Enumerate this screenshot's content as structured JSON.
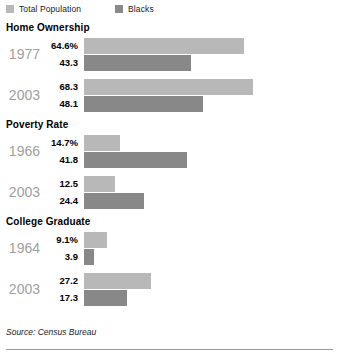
{
  "legend": {
    "items": [
      {
        "label": "Total Population",
        "color": "#b8b8b8",
        "swatch_name": "legend-swatch-total-population"
      },
      {
        "label": "Blacks",
        "color": "#888888",
        "swatch_name": "legend-swatch-blacks"
      }
    ]
  },
  "source": "Source: Census Bureau",
  "colors": {
    "total_population": "#b8b8b8",
    "blacks": "#888888",
    "year_label": "#a0a0a0",
    "rule": "#9a9a9a"
  },
  "sections": [
    {
      "title": "Home Ownership",
      "groups": [
        {
          "year": "1977",
          "bars": [
            {
              "value": "64.6%",
              "number": 64.6,
              "series": "Total Population"
            },
            {
              "value": "43.3",
              "number": 43.3,
              "series": "Blacks"
            }
          ]
        },
        {
          "year": "2003",
          "bars": [
            {
              "value": "68.3",
              "number": 68.3,
              "series": "Total Population"
            },
            {
              "value": "48.1",
              "number": 48.1,
              "series": "Blacks"
            }
          ]
        }
      ]
    },
    {
      "title": "Poverty Rate",
      "groups": [
        {
          "year": "1966",
          "bars": [
            {
              "value": "14.7%",
              "number": 14.7,
              "series": "Total Population"
            },
            {
              "value": "41.8",
              "number": 41.8,
              "series": "Blacks"
            }
          ]
        },
        {
          "year": "2003",
          "bars": [
            {
              "value": "12.5",
              "number": 12.5,
              "series": "Total Population"
            },
            {
              "value": "24.4",
              "number": 24.4,
              "series": "Blacks"
            }
          ]
        }
      ]
    },
    {
      "title": "College Graduate",
      "groups": [
        {
          "year": "1964",
          "bars": [
            {
              "value": "9.1%",
              "number": 9.1,
              "series": "Total Population"
            },
            {
              "value": "3.9",
              "number": 3.9,
              "series": "Blacks"
            }
          ]
        },
        {
          "year": "2003",
          "bars": [
            {
              "value": "27.2",
              "number": 27.2,
              "series": "Total Population"
            },
            {
              "value": "17.3",
              "number": 17.3,
              "series": "Blacks"
            }
          ]
        }
      ]
    }
  ],
  "chart_data": {
    "type": "bar",
    "title": "",
    "subtitle": "",
    "orientation": "horizontal",
    "xlabel": "",
    "ylabel": "",
    "grid": false,
    "legend_position": "top-left",
    "axis_visible": false,
    "value_unit": "percent",
    "px_per_unit": 2.47,
    "xlim": [
      0,
      70
    ],
    "panels": [
      {
        "title": "Home Ownership",
        "categories": [
          "1977",
          "2003"
        ],
        "series": [
          {
            "name": "Total Population",
            "values": [
              64.6,
              43.3
            ]
          }
        ]
      }
    ],
    "categories": [
      "Home Ownership 1977",
      "Home Ownership 2003",
      "Poverty Rate 1966",
      "Poverty Rate 2003",
      "College Graduate 1964",
      "College Graduate 2003"
    ],
    "series": [
      {
        "name": "Total Population",
        "color": "#b8b8b8",
        "values": [
          64.6,
          68.3,
          14.7,
          12.5,
          9.1,
          27.2
        ]
      },
      {
        "name": "Blacks",
        "color": "#888888",
        "values": [
          43.3,
          48.1,
          41.8,
          24.4,
          3.9,
          17.3
        ]
      }
    ],
    "annotations": [
      "Source: Census Bureau"
    ]
  }
}
